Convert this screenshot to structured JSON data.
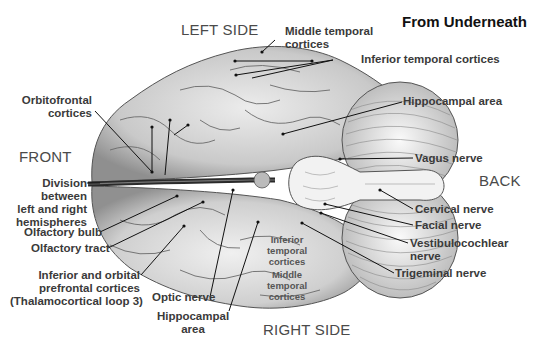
{
  "title": "From Underneath",
  "directions": {
    "left_side": "LEFT SIDE",
    "right_side": "RIGHT SIDE",
    "front": "FRONT",
    "back": "BACK"
  },
  "labels": {
    "middle_temporal_top": [
      "Middle temporal",
      "cortices"
    ],
    "inferior_temporal_top": "Inferior temporal cortices",
    "hippocampal_area_top": "Hippocampal area",
    "orbitofrontal": [
      "Orbitofrontal",
      "cortices"
    ],
    "division": [
      "Division",
      "between",
      "left and right",
      "hemispheres"
    ],
    "olfactory_bulb": "Olfactory bulb",
    "olfactory_tract": "Olfactory tract",
    "inferior_orbital_prefrontal": [
      "Inferior and orbital",
      "prefrontal cortices",
      "(Thalamocortical loop 3)"
    ],
    "optic_nerve": "Optic nerve",
    "hippocampal_area_bottom": [
      "Hippocampal",
      "area"
    ],
    "vagus_nerve": "Vagus nerve",
    "cervical_nerve": "Cervical nerve",
    "facial_nerve": "Facial nerve",
    "vestibulocochlear_nerve": [
      "Vestibulocochlear",
      "nerve"
    ],
    "trigeminal_nerve": "Trigeminal nerve",
    "inferior_temporal_inner": [
      "Inferior",
      "temporal",
      "cortices"
    ],
    "middle_temporal_inner": [
      "Middle",
      "temporal",
      "cortices"
    ]
  },
  "colors": {
    "label_text": "#3a3a3a",
    "title_text": "#111111",
    "brain_fill": "#d6d6d6",
    "brain_shadow": "#8a8a8a",
    "leader_line": "#111111"
  }
}
